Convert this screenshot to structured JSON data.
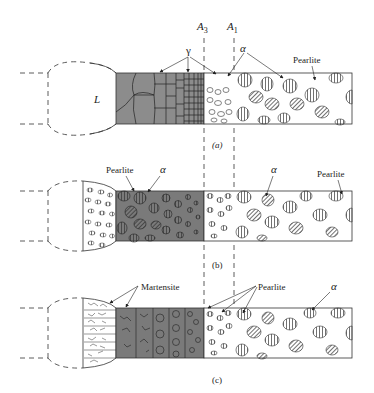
{
  "figure": {
    "lines": {
      "a3": {
        "label": "A",
        "sub": "3",
        "x": 204
      },
      "a1": {
        "label": "A",
        "sub": "1",
        "x": 234
      }
    },
    "colors": {
      "ink": "#2a2a2a",
      "gamma_fill": "#8c8c8c",
      "dark_fill": "#7a7a7a",
      "background": "#ffffff"
    },
    "panels": [
      {
        "id": "a",
        "caption": "(a)",
        "liquid_label": "L",
        "labels": [
          {
            "text": "γ",
            "x": 186,
            "y": 54,
            "italic": false
          },
          {
            "text": "α",
            "x": 243,
            "y": 49,
            "italic": true
          },
          {
            "text": "Pearlite",
            "x": 293,
            "y": 63,
            "italic": false
          }
        ]
      },
      {
        "id": "b",
        "caption": "(b)",
        "labels": [
          {
            "text": "Pearlite",
            "x": 106,
            "y": 173,
            "italic": false
          },
          {
            "text": "α",
            "x": 160,
            "y": 173,
            "italic": true
          },
          {
            "text": "α",
            "x": 271,
            "y": 173,
            "italic": true
          },
          {
            "text": "Pearlite",
            "x": 317,
            "y": 177,
            "italic": false
          }
        ]
      },
      {
        "id": "c",
        "caption": "(c)",
        "labels": [
          {
            "text": "Martensite",
            "x": 141,
            "y": 290,
            "italic": false
          },
          {
            "text": "Pearlite",
            "x": 258,
            "y": 290,
            "italic": false
          },
          {
            "text": "α",
            "x": 331,
            "y": 290,
            "italic": true
          }
        ]
      }
    ]
  }
}
